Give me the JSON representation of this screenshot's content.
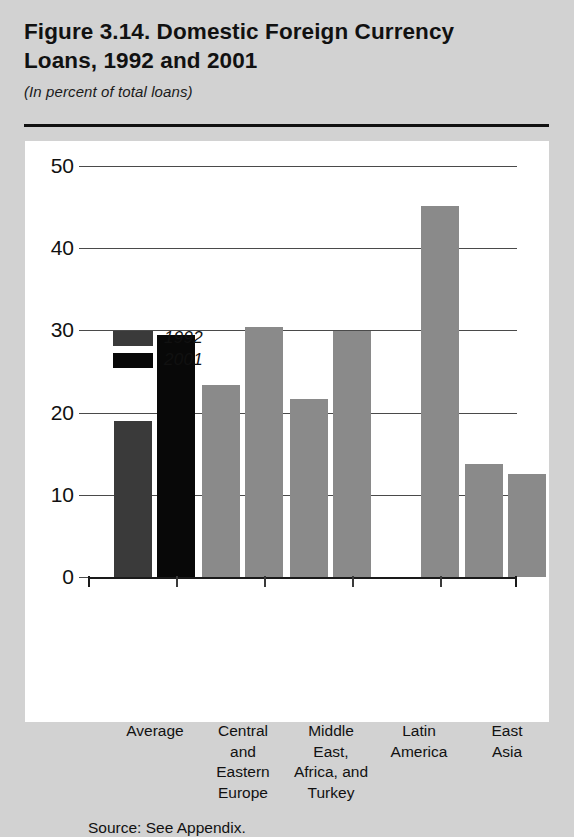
{
  "figure": {
    "title": "Figure 3.14. Domestic Foreign Currency Loans, 1992 and 2001",
    "title_line1": "Figure 3.14. Domestic Foreign Currency",
    "title_line2": "Loans, 1992 and 2001",
    "subtitle": "(In percent of total loans)",
    "source": "Source: See Appendix."
  },
  "colors": {
    "page_background": "#d2d2d2",
    "panel_background": "#ffffff",
    "series_1992_average": "#3a3a3a",
    "series_2001_average": "#080808",
    "series_gray": "#8a8a8a",
    "axis": "#1a1a1a",
    "gridline": "#4a4a4a",
    "text": "#111111"
  },
  "chart_data": {
    "type": "bar",
    "title": "Figure 3.14. Domestic Foreign Currency Loans, 1992 and 2001",
    "subtitle": "(In percent of total loans)",
    "xlabel": "",
    "ylabel": "",
    "ylim": [
      0,
      50
    ],
    "yticks": [
      0,
      10,
      20,
      30,
      40,
      50
    ],
    "ytick_labels": [
      "0",
      "10",
      "20",
      "30",
      "40",
      "50"
    ],
    "grid": true,
    "legend_position": "top-left-inside",
    "categories": [
      "Average",
      "Central and Eastern Europe",
      "Middle East, Africa, and Turkey",
      "Latin America",
      "East Asia"
    ],
    "category_label_lines": [
      [
        "Average"
      ],
      [
        "Central",
        "and",
        "Eastern",
        "Europe"
      ],
      [
        "Middle",
        "East,",
        "Africa, and",
        "Turkey"
      ],
      [
        "Latin",
        "America"
      ],
      [
        "East",
        "Asia"
      ]
    ],
    "series": [
      {
        "name": "1992",
        "values": [
          19.0,
          23.4,
          21.7,
          null,
          13.7
        ]
      },
      {
        "name": "2001",
        "values": [
          29.4,
          30.4,
          29.9,
          45.1,
          12.5
        ]
      }
    ],
    "legend": [
      "1992",
      "2001"
    ]
  },
  "bars": [
    {
      "name": "bar-average-1992",
      "series": "1992",
      "category": "Average",
      "value": 19.0,
      "color": "#3a3a3a",
      "left": 26,
      "width": 38
    },
    {
      "name": "bar-average-2001",
      "series": "2001",
      "category": "Average",
      "value": 29.4,
      "color": "#080808",
      "left": 69,
      "width": 38
    },
    {
      "name": "bar-cee-1992",
      "series": "1992",
      "category": "Central and Eastern Europe",
      "value": 23.4,
      "color": "#8a8a8a",
      "left": 114,
      "width": 38
    },
    {
      "name": "bar-cee-2001",
      "series": "2001",
      "category": "Central and Eastern Europe",
      "value": 30.4,
      "color": "#8a8a8a",
      "left": 157,
      "width": 38
    },
    {
      "name": "bar-meat-1992",
      "series": "1992",
      "category": "Middle East, Africa, and Turkey",
      "value": 21.7,
      "color": "#8a8a8a",
      "left": 202,
      "width": 38
    },
    {
      "name": "bar-meat-2001",
      "series": "2001",
      "category": "Middle East, Africa, and Turkey",
      "value": 29.9,
      "color": "#8a8a8a",
      "left": 245,
      "width": 38
    },
    {
      "name": "bar-latinamerica-2001",
      "series": "2001",
      "category": "Latin America",
      "value": 45.1,
      "color": "#8a8a8a",
      "left": 333,
      "width": 38
    },
    {
      "name": "bar-eastasia-1992",
      "series": "1992",
      "category": "East Asia",
      "value": 13.7,
      "color": "#8a8a8a",
      "left": 377,
      "width": 38
    },
    {
      "name": "bar-eastasia-2001",
      "series": "2001",
      "category": "East Asia",
      "value": 12.5,
      "color": "#8a8a8a",
      "left": 420,
      "width": 38
    }
  ],
  "legend_swatches": [
    {
      "name": "legend-swatch-1992",
      "label": "1992",
      "color": "#3a3a3a"
    },
    {
      "name": "legend-swatch-2001",
      "label": "2001",
      "color": "#080808"
    }
  ],
  "category_centers": [
    67,
    155,
    243,
    331,
    419
  ],
  "xtick_positions": [
    0,
    88,
    176,
    264,
    352,
    429
  ]
}
